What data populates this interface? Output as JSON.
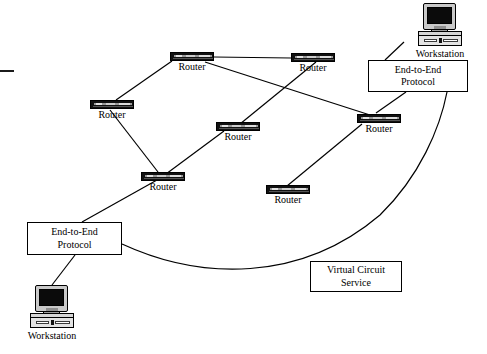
{
  "diagram": {
    "line_color": "#000000",
    "node_color": "#111111",
    "background": "#ffffff"
  },
  "nodes": {
    "routers": [
      {
        "id": "router-top-left",
        "label": "Router",
        "x": 170,
        "y": 52
      },
      {
        "id": "router-top-right",
        "label": "Router",
        "x": 291,
        "y": 53
      },
      {
        "id": "router-left",
        "label": "Router",
        "x": 90,
        "y": 100
      },
      {
        "id": "router-center",
        "label": "Router",
        "x": 216,
        "y": 122
      },
      {
        "id": "router-right",
        "label": "Router",
        "x": 357,
        "y": 114
      },
      {
        "id": "router-lower-left",
        "label": "Router",
        "x": 141,
        "y": 172
      },
      {
        "id": "router-lower-center",
        "label": "Router",
        "x": 266,
        "y": 185
      }
    ],
    "workstations": [
      {
        "id": "workstation-top-right",
        "label": "Workstation",
        "x": 415,
        "y": 3
      },
      {
        "id": "workstation-bottom-left",
        "label": "Workstation",
        "x": 26,
        "y": 285
      }
    ],
    "boxes": [
      {
        "id": "end-to-end-protocol-top-right",
        "label": "End-to-End\nProtocol",
        "x": 368,
        "y": 60,
        "w": 100,
        "h": 32
      },
      {
        "id": "end-to-end-protocol-bottom-left",
        "label": "End-to-End\nProtocol",
        "x": 27,
        "y": 222,
        "w": 95,
        "h": 33
      },
      {
        "id": "virtual-circuit-service",
        "label": "Virtual Circuit\nService",
        "x": 310,
        "y": 261,
        "w": 92,
        "h": 31
      }
    ]
  },
  "links": [
    {
      "from": "router-top-left",
      "to": "router-top-right",
      "type": "straight"
    },
    {
      "from": "router-top-left",
      "to": "router-left",
      "type": "straight"
    },
    {
      "from": "router-top-left",
      "to": "router-right",
      "type": "straight"
    },
    {
      "from": "router-top-right",
      "to": "router-center",
      "type": "straight"
    },
    {
      "from": "router-left",
      "to": "router-lower-left",
      "type": "straight"
    },
    {
      "from": "router-center",
      "to": "router-lower-left",
      "type": "straight"
    },
    {
      "from": "router-lower-left",
      "to": "end-to-end-protocol-bottom-left",
      "type": "straight"
    },
    {
      "from": "router-lower-center",
      "to": "router-right",
      "type": "straight"
    },
    {
      "from": "router-right",
      "to": "end-to-end-protocol-top-right",
      "type": "straight"
    },
    {
      "from": "end-to-end-protocol-top-right",
      "to": "workstation-top-right",
      "type": "straight"
    },
    {
      "from": "end-to-end-protocol-bottom-left",
      "to": "workstation-bottom-left",
      "type": "straight"
    },
    {
      "from": "end-to-end-protocol-bottom-left",
      "to": "end-to-end-protocol-top-right",
      "type": "curve",
      "note": "virtual circuit"
    }
  ],
  "marks": {
    "left_edge_tick": {
      "x": 0,
      "y": 70,
      "w": 14,
      "h": 2
    }
  }
}
